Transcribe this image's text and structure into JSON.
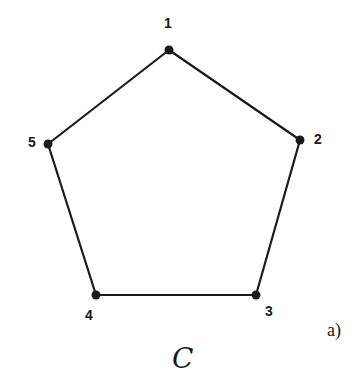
{
  "graph": {
    "name": "C",
    "panel_label": "a)",
    "vertices": [
      {
        "id": "1",
        "x": 169,
        "y": 50,
        "label_x": 168,
        "label_y": 28
      },
      {
        "id": "2",
        "x": 300,
        "y": 140,
        "label_x": 318,
        "label_y": 144
      },
      {
        "id": "3",
        "x": 256,
        "y": 295,
        "label_x": 269,
        "label_y": 316
      },
      {
        "id": "4",
        "x": 96,
        "y": 295,
        "label_x": 89,
        "label_y": 320
      },
      {
        "id": "5",
        "x": 48,
        "y": 144,
        "label_x": 32,
        "label_y": 147
      }
    ],
    "edges": [
      [
        "1",
        "2"
      ],
      [
        "2",
        "3"
      ],
      [
        "3",
        "4"
      ],
      [
        "4",
        "5"
      ],
      [
        "5",
        "1"
      ]
    ],
    "colors": {
      "stroke": "#1a1a1a",
      "background": "#ffffff"
    }
  }
}
